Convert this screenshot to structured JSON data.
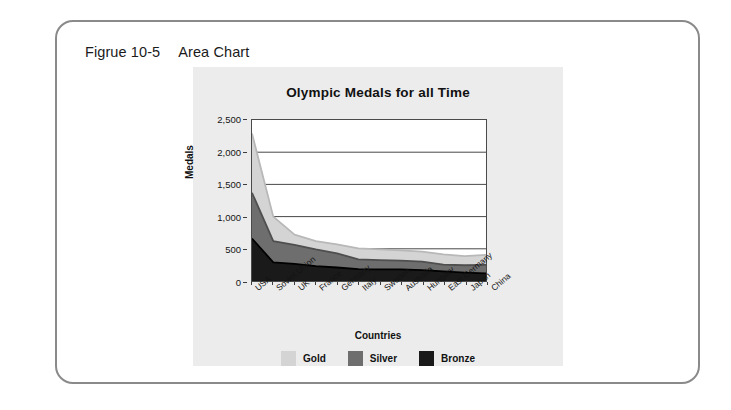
{
  "figure": {
    "caption_number": "Figrue 10-5",
    "caption_text": "Area Chart"
  },
  "colors": {
    "card_border": "#8a8a8a",
    "panel_background": "#ececec",
    "plot_background": "#ffffff",
    "axis": "#4a4a4a",
    "gridline": "#333333",
    "gold": "#d4d4d4",
    "gold_line": "#b8b8b8",
    "silver": "#6e6e6e",
    "silver_line": "#4f4f4f",
    "bronze": "#1a1a1a",
    "bronze_line": "#000000"
  },
  "legend": {
    "position": "bottom",
    "items": [
      {
        "label": "Gold",
        "color": "#d4d4d4"
      },
      {
        "label": "Silver",
        "color": "#6e6e6e"
      },
      {
        "label": "Bronze",
        "color": "#1a1a1a"
      }
    ]
  },
  "chart_data": {
    "type": "area",
    "title": "Olympic Medals for all Time",
    "xlabel": "Countries",
    "ylabel": "Medals",
    "ylim": [
      0,
      2500
    ],
    "yticks": [
      0,
      500,
      1000,
      1500,
      2000,
      2500
    ],
    "ytick_labels": [
      "0",
      "500",
      "1,000",
      "1,500",
      "2,000",
      "2,500"
    ],
    "grid": true,
    "stacked": false,
    "categories": [
      "USA",
      "Soviet Union",
      "UK",
      "France",
      "Germany",
      "Italy",
      "Sweden",
      "Australia",
      "Hungary",
      "East Germany",
      "Japan",
      "China"
    ],
    "series": [
      {
        "name": "Gold",
        "color": "#d4d4d4",
        "values": [
          2290,
          1000,
          720,
          620,
          570,
          505,
          490,
          475,
          455,
          415,
          385,
          405
        ]
      },
      {
        "name": "Silver",
        "color": "#6e6e6e",
        "values": [
          1370,
          620,
          560,
          490,
          430,
          335,
          325,
          315,
          300,
          255,
          245,
          250
        ]
      },
      {
        "name": "Bronze",
        "color": "#1a1a1a",
        "values": [
          660,
          290,
          265,
          230,
          210,
          185,
          180,
          180,
          170,
          150,
          130,
          120
        ]
      }
    ]
  }
}
